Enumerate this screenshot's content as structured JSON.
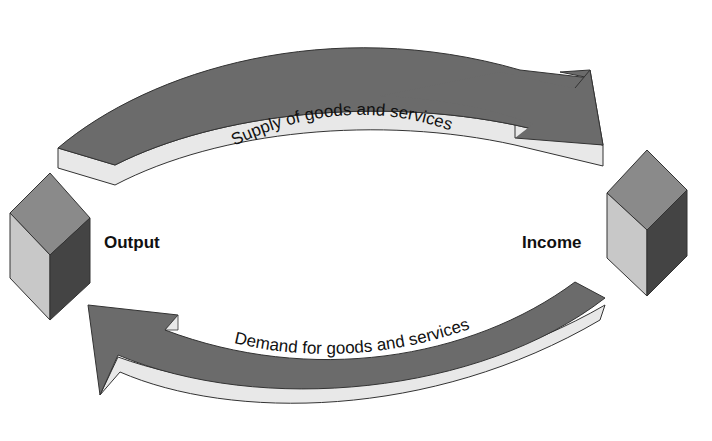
{
  "diagram": {
    "type": "circular-flow",
    "nodes": [
      {
        "id": "output",
        "label": "Output",
        "shape": "cube",
        "position": "left"
      },
      {
        "id": "income",
        "label": "Income",
        "shape": "cube",
        "position": "right"
      }
    ],
    "edges": [
      {
        "from": "output",
        "to": "income",
        "label": "Supply of goods and services",
        "position": "top"
      },
      {
        "from": "income",
        "to": "output",
        "label": "Demand for goods and services",
        "position": "bottom"
      }
    ]
  },
  "colors": {
    "arrow_top_face": "#6b6b6b",
    "arrow_side_face": "#e6e6e6",
    "cube_top": "#8a8a8a",
    "cube_left": "#c8c8c8",
    "cube_right": "#444444",
    "outline": "#333333",
    "text": "#111111"
  }
}
